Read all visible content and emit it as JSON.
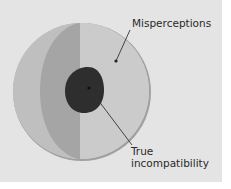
{
  "diagram": {
    "labels": {
      "misperceptions": "Misperceptions",
      "true_line1": "True",
      "true_line2": "incompatibility"
    },
    "colors": {
      "panel_background": "#e4e4e4",
      "outer_circle_light": "#c8c8c8",
      "outer_left_band": "#bdbdbd",
      "middle_band": "#a3a3a3",
      "outer_rim": "#9a9a9a",
      "inner_core": "#2f2f2f",
      "leader_line": "#333333"
    }
  }
}
